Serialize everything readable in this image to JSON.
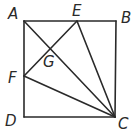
{
  "figure": {
    "type": "geometry",
    "points": {
      "A": {
        "label": "A",
        "x": 24,
        "y": 21
      },
      "B": {
        "label": "B",
        "x": 116,
        "y": 21
      },
      "C": {
        "label": "C",
        "x": 115,
        "y": 117
      },
      "D": {
        "label": "D",
        "x": 24,
        "y": 117
      },
      "E": {
        "label": "E",
        "x": 77,
        "y": 21
      },
      "F": {
        "label": "F",
        "x": 24,
        "y": 76
      },
      "G": {
        "label": "G",
        "x": 50,
        "y": 50
      }
    },
    "segments": [
      "AB",
      "BC",
      "CD",
      "DA",
      "AC",
      "EF",
      "EC",
      "FC"
    ],
    "line_color": "#2a2a2a"
  }
}
